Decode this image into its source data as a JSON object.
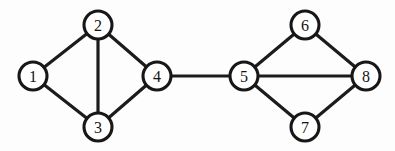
{
  "figure": {
    "kind": "undirected-graph-diagram",
    "title": "",
    "background_color": "#fdfdfd",
    "edge_color": "#1c1c1c",
    "node_fill_color": "#ffffff",
    "node_stroke_color": "#171717",
    "label_color": "#141414",
    "node_radius": 14,
    "edge_stroke_width": 3.2,
    "node_stroke_width": 3.1
  },
  "graph": {
    "node_count": 8,
    "edge_count": 11,
    "nodes": [
      {
        "id": "1",
        "label": "1",
        "cx": 33,
        "cy": 76,
        "cluster": "left"
      },
      {
        "id": "2",
        "label": "2",
        "cx": 98,
        "cy": 25,
        "cluster": "left"
      },
      {
        "id": "3",
        "label": "3",
        "cx": 98,
        "cy": 127,
        "cluster": "left"
      },
      {
        "id": "4",
        "label": "4",
        "cx": 157,
        "cy": 76,
        "cluster": "left"
      },
      {
        "id": "5",
        "label": "5",
        "cx": 244,
        "cy": 76,
        "cluster": "right"
      },
      {
        "id": "6",
        "label": "6",
        "cx": 305,
        "cy": 25,
        "cluster": "right"
      },
      {
        "id": "7",
        "label": "7",
        "cx": 305,
        "cy": 127,
        "cluster": "right"
      },
      {
        "id": "8",
        "label": "8",
        "cx": 366,
        "cy": 76,
        "cluster": "right"
      }
    ],
    "edges": [
      {
        "id": "e1-2",
        "source": "1",
        "target": "2"
      },
      {
        "id": "e1-3",
        "source": "1",
        "target": "3"
      },
      {
        "id": "e2-3",
        "source": "2",
        "target": "3"
      },
      {
        "id": "e2-4",
        "source": "2",
        "target": "4"
      },
      {
        "id": "e3-4",
        "source": "3",
        "target": "4"
      },
      {
        "id": "e4-5",
        "source": "4",
        "target": "5"
      },
      {
        "id": "e5-6",
        "source": "5",
        "target": "6"
      },
      {
        "id": "e5-7",
        "source": "5",
        "target": "7"
      },
      {
        "id": "e5-8",
        "source": "5",
        "target": "8"
      },
      {
        "id": "e6-8",
        "source": "6",
        "target": "8"
      },
      {
        "id": "e7-8",
        "source": "7",
        "target": "8"
      }
    ]
  }
}
